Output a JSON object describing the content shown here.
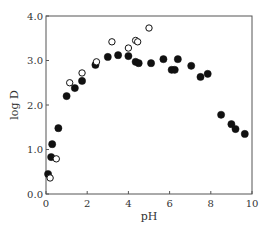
{
  "chart_data": {
    "type": "scatter",
    "title": "",
    "xlabel": "pH",
    "ylabel": "log D",
    "xlim": [
      0,
      10
    ],
    "ylim": [
      0,
      4
    ],
    "xticks": [
      0,
      2,
      4,
      6,
      8,
      10
    ],
    "xtick_labels": [
      "0",
      "2",
      "4",
      "6",
      "8",
      "10"
    ],
    "yticks": [
      0,
      1,
      2,
      3,
      4
    ],
    "ytick_labels": [
      "0.0",
      "1.0",
      "2.0",
      "3.0",
      "4.0"
    ],
    "grid": false,
    "legend": null,
    "series": [
      {
        "name": "filled",
        "marker": "filled-circle",
        "color": "#111111",
        "points": [
          [
            0.1,
            0.45
          ],
          [
            0.25,
            0.83
          ],
          [
            0.3,
            1.12
          ],
          [
            0.6,
            1.48
          ],
          [
            1.0,
            2.2
          ],
          [
            1.4,
            2.38
          ],
          [
            1.75,
            2.54
          ],
          [
            2.4,
            2.9
          ],
          [
            3.0,
            3.08
          ],
          [
            3.5,
            3.12
          ],
          [
            4.0,
            3.1
          ],
          [
            4.35,
            2.97
          ],
          [
            4.5,
            2.94
          ],
          [
            5.1,
            2.94
          ],
          [
            5.7,
            3.03
          ],
          [
            6.1,
            2.79
          ],
          [
            6.25,
            2.79
          ],
          [
            6.4,
            3.03
          ],
          [
            7.05,
            2.88
          ],
          [
            7.5,
            2.63
          ],
          [
            7.85,
            2.7
          ],
          [
            8.5,
            1.78
          ],
          [
            9.0,
            1.57
          ],
          [
            9.2,
            1.46
          ],
          [
            9.65,
            1.35
          ]
        ]
      },
      {
        "name": "open",
        "marker": "open-circle",
        "color": "#111111",
        "points": [
          [
            0.2,
            0.36
          ],
          [
            0.5,
            0.79
          ],
          [
            1.15,
            2.5
          ],
          [
            1.75,
            2.72
          ],
          [
            2.45,
            2.97
          ],
          [
            3.2,
            3.42
          ],
          [
            4.0,
            3.28
          ],
          [
            4.35,
            3.45
          ],
          [
            4.45,
            3.42
          ],
          [
            5.0,
            3.73
          ]
        ]
      }
    ]
  },
  "layout": {
    "plot_left": 46,
    "plot_right": 252,
    "plot_top": 16,
    "plot_bottom": 194,
    "axis_color": "#555555",
    "marker_radius": 3.6
  }
}
